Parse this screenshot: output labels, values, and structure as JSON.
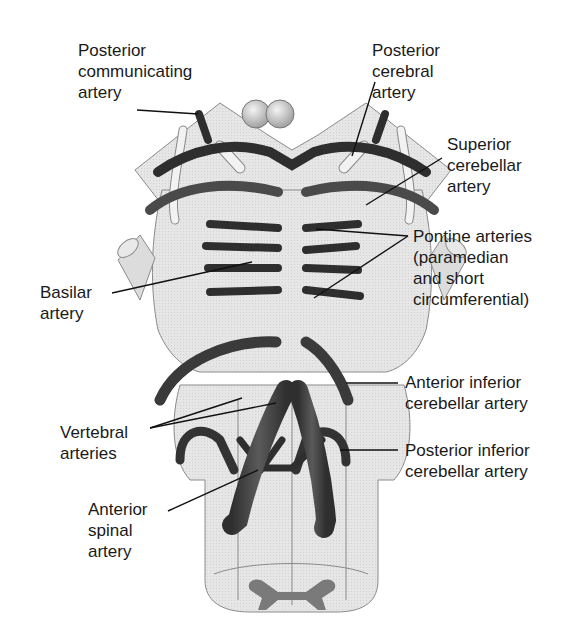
{
  "diagram": {
    "colors": {
      "background": "#ffffff",
      "tissue": "#e4e4e4",
      "tissue_outline": "#8a8a8a",
      "artery": "#4a4a4a",
      "artery_dark": "#2e2e2e",
      "nerve": "#f2f2f2",
      "leader_line": "#111111",
      "text": "#1a1a1a"
    },
    "labels": [
      {
        "id": "posterior-communicating-artery",
        "text": "Posterior\ncommunicating\nartery",
        "x": 78,
        "y": 40
      },
      {
        "id": "posterior-cerebral-artery",
        "text": "Posterior\ncerebral\nartery",
        "x": 372,
        "y": 40
      },
      {
        "id": "superior-cerebellar-artery",
        "text": "Superior\ncerebellar\nartery",
        "x": 447,
        "y": 134
      },
      {
        "id": "pontine-arteries",
        "text": "Pontine arteries\n(paramedian\nand short\ncircumferential)",
        "x": 413,
        "y": 226
      },
      {
        "id": "basilar-artery",
        "text": "Basilar\nartery",
        "x": 40,
        "y": 282
      },
      {
        "id": "anterior-inferior-cerebellar-artery",
        "text": "Anterior inferior\ncerebellar artery",
        "x": 405,
        "y": 376
      },
      {
        "id": "vertebral-arteries",
        "text": "Vertebral\narteries",
        "x": 60,
        "y": 422
      },
      {
        "id": "posterior-inferior-cerebellar-artery",
        "text": "Posterior inferior\ncerebellar artery",
        "x": 405,
        "y": 442
      },
      {
        "id": "anterior-spinal-artery",
        "text": "Anterior\nspinal\nartery",
        "x": 88,
        "y": 499
      }
    ]
  }
}
